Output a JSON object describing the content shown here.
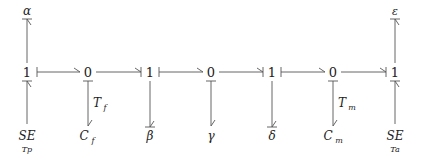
{
  "diagram": {
    "type": "bond-graph",
    "junctions": [
      {
        "id": "j1",
        "label": "1",
        "x": 27
      },
      {
        "id": "j2",
        "label": "0",
        "x": 88
      },
      {
        "id": "j3",
        "label": "1",
        "x": 150
      },
      {
        "id": "j4",
        "label": "0",
        "x": 211
      },
      {
        "id": "j5",
        "label": "1",
        "x": 272
      },
      {
        "id": "j6",
        "label": "0",
        "x": 333
      },
      {
        "id": "j7",
        "label": "1",
        "x": 395
      }
    ],
    "top_elements": [
      {
        "label": "α",
        "attached_to": "j1"
      },
      {
        "label": "ε",
        "attached_to": "j7"
      }
    ],
    "bottom_elements": [
      {
        "label": "SE",
        "sub": "Tp",
        "attached_to": "j1"
      },
      {
        "label": "C",
        "sub": "f",
        "attached_to": "j2",
        "bond_label": "T",
        "bond_sub": "f"
      },
      {
        "label": "β",
        "attached_to": "j3"
      },
      {
        "label": "γ",
        "attached_to": "j4"
      },
      {
        "label": "δ",
        "attached_to": "j5"
      },
      {
        "label": "C",
        "sub": "m",
        "attached_to": "j6",
        "bond_label": "T",
        "bond_sub": "m"
      },
      {
        "label": "SE",
        "sub": "Ta",
        "attached_to": "j7"
      }
    ]
  }
}
